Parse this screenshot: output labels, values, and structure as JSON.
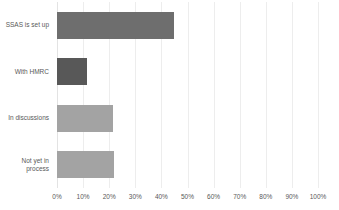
{
  "chart_data": {
    "type": "bar",
    "orientation": "horizontal",
    "title": "",
    "xlabel": "",
    "ylabel": "",
    "categories": [
      "SSAS is set up",
      "With HMRC",
      "In discussions",
      "Not yet in\nprocess"
    ],
    "values": [
      45,
      11.5,
      21.5,
      22
    ],
    "value_suffix": "%",
    "xlim": [
      0,
      100
    ],
    "xticks": [
      0,
      10,
      20,
      30,
      40,
      50,
      60,
      70,
      80,
      90,
      100
    ],
    "xticklabels": [
      "0%",
      "10%",
      "20%",
      "30%",
      "40%",
      "50%",
      "60%",
      "70%",
      "80%",
      "90%",
      "100%"
    ],
    "grid": true,
    "grid_axis": "x",
    "legend": false,
    "bar_colors": [
      "#6e6e6e",
      "#585858",
      "#a3a3a3",
      "#a3a3a3"
    ],
    "grid_color": "#ededed",
    "background": "#ffffff",
    "text_color": "#595959"
  },
  "chart": {
    "title_clipped": "",
    "categories": [
      {
        "label_line1": "SSAS is set up",
        "label_line2": "",
        "value": 45
      },
      {
        "label_line1": "With HMRC",
        "label_line2": "",
        "value": 11.5
      },
      {
        "label_line1": "In discussions",
        "label_line2": "",
        "value": 21.5
      },
      {
        "label_line1": "Not yet in",
        "label_line2": "process",
        "value": 22
      }
    ],
    "xticklabels": [
      "0%",
      "10%",
      "20%",
      "30%",
      "40%",
      "50%",
      "60%",
      "70%",
      "80%",
      "90%",
      "100%"
    ]
  }
}
